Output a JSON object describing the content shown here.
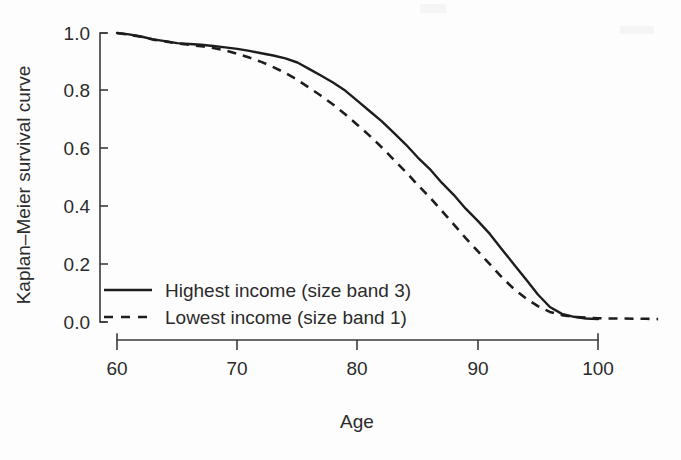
{
  "chart_data": {
    "type": "line",
    "title": "",
    "xlabel": "Age",
    "ylabel": "Kaplan–Meier survival curve",
    "xlim": [
      60,
      105
    ],
    "ylim": [
      0.0,
      1.0
    ],
    "grid": false,
    "legend_position": "lower-left inside axes",
    "xticks": [
      "60",
      "70",
      "80",
      "90",
      "100"
    ],
    "xtick_values": [
      60,
      70,
      80,
      90,
      100
    ],
    "yticks": [
      "1.0",
      "0.8",
      "0.6",
      "0.4",
      "0.2",
      "0.0"
    ],
    "ytick_values": [
      1.0,
      0.8,
      0.6,
      0.4,
      0.2,
      0.0
    ],
    "series": [
      {
        "name": "Highest income (size band 3)",
        "style": "solid",
        "color": "#1d1d1d",
        "x": [
          60,
          61,
          62,
          63,
          64,
          65,
          66,
          67,
          68,
          69,
          70,
          71,
          72,
          73,
          74,
          75,
          76,
          77,
          78,
          79,
          80,
          81,
          82,
          83,
          84,
          85,
          86,
          87,
          88,
          89,
          90,
          91,
          92,
          93,
          94,
          95,
          96,
          97,
          98,
          99,
          100
        ],
        "y": [
          1.0,
          0.995,
          0.988,
          0.978,
          0.972,
          0.965,
          0.962,
          0.959,
          0.955,
          0.95,
          0.945,
          0.938,
          0.93,
          0.922,
          0.912,
          0.898,
          0.875,
          0.852,
          0.828,
          0.8,
          0.765,
          0.73,
          0.695,
          0.655,
          0.615,
          0.57,
          0.53,
          0.482,
          0.44,
          0.392,
          0.35,
          0.305,
          0.252,
          0.2,
          0.148,
          0.095,
          0.052,
          0.028,
          0.018,
          0.012,
          0.01
        ]
      },
      {
        "name": "Lowest income (size band 1)",
        "style": "dashed",
        "color": "#1d1d1d",
        "x": [
          60,
          61,
          62,
          63,
          64,
          65,
          66,
          67,
          68,
          69,
          70,
          71,
          72,
          73,
          74,
          75,
          76,
          77,
          78,
          79,
          80,
          81,
          82,
          83,
          84,
          85,
          86,
          87,
          88,
          89,
          90,
          91,
          92,
          93,
          94,
          95,
          96,
          97,
          98,
          99,
          100,
          101,
          102,
          103,
          104,
          105
        ],
        "y": [
          1.0,
          0.994,
          0.987,
          0.977,
          0.971,
          0.964,
          0.959,
          0.954,
          0.948,
          0.94,
          0.928,
          0.915,
          0.9,
          0.882,
          0.862,
          0.838,
          0.81,
          0.782,
          0.752,
          0.718,
          0.682,
          0.645,
          0.605,
          0.562,
          0.52,
          0.475,
          0.432,
          0.385,
          0.338,
          0.29,
          0.245,
          0.2,
          0.155,
          0.115,
          0.082,
          0.055,
          0.035,
          0.024,
          0.018,
          0.015,
          0.013,
          0.012,
          0.012,
          0.011,
          0.011,
          0.01
        ]
      }
    ],
    "annotations": []
  },
  "axes": {
    "y_axis_title": "Kaplan–Meier survival curve",
    "x_axis_title": "Age",
    "x_tick_labels": [
      "60",
      "70",
      "80",
      "90",
      "100"
    ],
    "y_tick_labels": [
      "1.0",
      "0.8",
      "0.6",
      "0.4",
      "0.2",
      "0.0"
    ]
  },
  "legend": {
    "items": [
      {
        "label": "Highest income (size band 3)",
        "style": "solid"
      },
      {
        "label": "Lowest income (size band 1)",
        "style": "dashed"
      }
    ]
  }
}
